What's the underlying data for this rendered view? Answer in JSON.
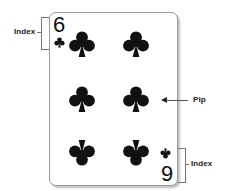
{
  "diagram": {
    "card": {
      "rank_top": "6",
      "rank_bottom": "6",
      "suit": "clubs",
      "suit_icon": "club-icon",
      "suit_color": "#111111",
      "pip_count": 6
    },
    "labels": {
      "index_top": "Index",
      "pip": "Pip",
      "index_bottom": "Index"
    }
  }
}
